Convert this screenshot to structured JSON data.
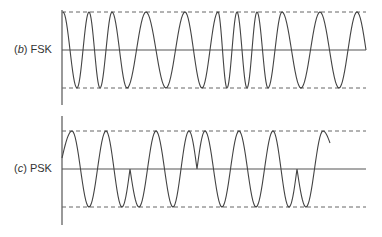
{
  "panels": [
    {
      "id": "fsk",
      "label_letter": "b",
      "label_text": "FSK",
      "label_pos": {
        "x": 14,
        "y": 43
      },
      "axis": {
        "x": 62,
        "y_top": 10,
        "y_bottom": 105
      },
      "baseline_y": 50,
      "top_dash_y": 12,
      "bottom_dash_y": 88,
      "x_end": 366,
      "wave": {
        "start": {
          "x": 63,
          "type": "peak"
        },
        "extrema_x": [
          63,
          77,
          89,
          100,
          112,
          127,
          146,
          166,
          185,
          202,
          218,
          227,
          237,
          247,
          257,
          268,
          282,
          301,
          320,
          339,
          357
        ],
        "end": {
          "x": 366,
          "y": 50
        }
      }
    },
    {
      "id": "psk",
      "label_letter": "c",
      "label_text": "PSK",
      "label_pos": {
        "x": 14,
        "y": 162
      },
      "axis": {
        "x": 62,
        "y_top": 116,
        "y_bottom": 225
      },
      "baseline_y": 169,
      "top_dash_y": 131,
      "bottom_dash_y": 207,
      "x_end": 366,
      "wave": {
        "points": [
          [
            62,
            160,
            "start"
          ],
          [
            72,
            131,
            "peak"
          ],
          [
            88,
            169,
            "zero"
          ],
          [
            104,
            207,
            "trough"
          ],
          [
            120,
            169,
            "zero"
          ],
          [
            105,
            131,
            "note"
          ]
        ],
        "segments": [
          {
            "from": [
              62,
              158
            ],
            "to": [
              72,
              131
            ],
            "kind": "rise-to-peak"
          },
          {
            "from": [
              72,
              131
            ],
            "to": [
              89,
              207
            ],
            "kind": "peak-to-trough"
          },
          {
            "from": [
              89,
              207
            ],
            "to": [
              106,
              131
            ],
            "kind": "trough-to-peak"
          },
          {
            "from": [
              106,
              131
            ],
            "to": [
              122,
              207
            ],
            "kind": "peak-to-trough"
          },
          {
            "from": [
              122,
              207
            ],
            "to": [
              130,
              169
            ],
            "kind": "trough-to-cusp"
          },
          {
            "from": [
              130,
              169
            ],
            "to": [
              139,
              207
            ],
            "kind": "cusp-to-trough"
          },
          {
            "from": [
              139,
              207
            ],
            "to": [
              156,
              131
            ],
            "kind": "trough-to-peak"
          },
          {
            "from": [
              156,
              131
            ],
            "to": [
              173,
              207
            ],
            "kind": "peak-to-trough"
          },
          {
            "from": [
              173,
              207
            ],
            "to": [
              189,
              131
            ],
            "kind": "trough-to-peak"
          },
          {
            "from": [
              189,
              131
            ],
            "to": [
              197,
              169
            ],
            "kind": "peak-to-cusp"
          },
          {
            "from": [
              197,
              169
            ],
            "to": [
              205,
              131
            ],
            "kind": "cusp-to-peak"
          },
          {
            "from": [
              205,
              131
            ],
            "to": [
              222,
              207
            ],
            "kind": "peak-to-trough"
          },
          {
            "from": [
              222,
              207
            ],
            "to": [
              239,
              131
            ],
            "kind": "trough-to-peak"
          },
          {
            "from": [
              239,
              131
            ],
            "to": [
              256,
              207
            ],
            "kind": "peak-to-trough"
          },
          {
            "from": [
              256,
              207
            ],
            "to": [
              273,
              131
            ],
            "kind": "trough-to-peak"
          },
          {
            "from": [
              273,
              131
            ],
            "to": [
              289,
              207
            ],
            "kind": "peak-to-trough"
          },
          {
            "from": [
              289,
              207
            ],
            "to": [
              297,
              169
            ],
            "kind": "trough-to-cusp"
          },
          {
            "from": [
              297,
              169
            ],
            "to": [
              306,
              207
            ],
            "kind": "cusp-to-trough"
          },
          {
            "from": [
              306,
              207
            ],
            "to": [
              323,
              131
            ],
            "kind": "trough-to-peak"
          },
          {
            "from": [
              323,
              131
            ],
            "to": [
              330,
              143
            ],
            "kind": "peak-to-end"
          }
        ]
      }
    }
  ],
  "style": {
    "line_color": "#555555",
    "dash_color": "#666666",
    "wave_color": "#444444",
    "label_color": "#333333"
  }
}
